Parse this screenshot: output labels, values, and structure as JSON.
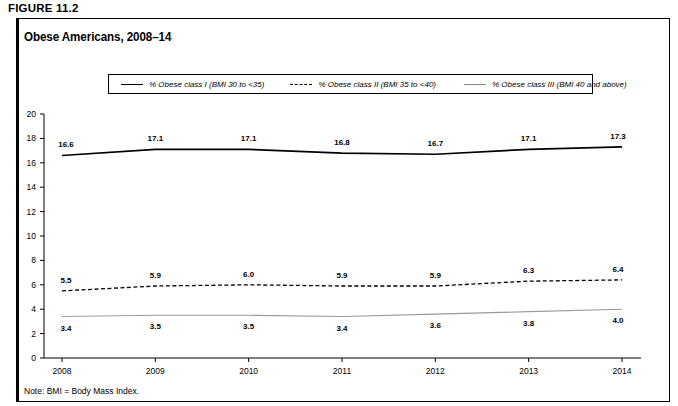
{
  "figure_label": "FIGURE 11.2",
  "chart_title": "Obese Americans, 2008–14",
  "note": "Note: BMI = Body Mass Index.",
  "legend": {
    "items": [
      {
        "label": "% Obese class I (BMI 30 to <35)",
        "style": "solid",
        "color": "#000000"
      },
      {
        "label": "% Obese class II (BMI 35 to <40)",
        "style": "dashed",
        "color": "#000000"
      },
      {
        "label": "% Obese class III (BMI 40 and above)",
        "style": "thin-solid",
        "color": "#8a8a8a"
      }
    ]
  },
  "chart_data": {
    "type": "line",
    "title": "Obese Americans, 2008–14",
    "xlabel": "",
    "ylabel": "",
    "categories": [
      "2008",
      "2009",
      "2010",
      "2011",
      "2012",
      "2013",
      "2014"
    ],
    "ylim": [
      0,
      20
    ],
    "yticks": [
      "0",
      "2",
      "4",
      "6",
      "8",
      "10",
      "12",
      "14",
      "16",
      "18",
      "20"
    ],
    "grid": false,
    "legend_position": "top",
    "series": [
      {
        "name": "% Obese class I (BMI 30 to <35)",
        "values": [
          16.6,
          17.1,
          17.1,
          16.8,
          16.7,
          17.1,
          17.3
        ],
        "labels": [
          "16.6",
          "17.1",
          "17.1",
          "16.8",
          "16.7",
          "17.1",
          "17.3"
        ]
      },
      {
        "name": "% Obese class II (BMI 35 to <40)",
        "values": [
          5.5,
          5.9,
          6.0,
          5.9,
          5.9,
          6.3,
          6.4
        ],
        "labels": [
          "5.5",
          "5.9",
          "6.0",
          "5.9",
          "5.9",
          "6.3",
          "6.4"
        ]
      },
      {
        "name": "% Obese class III (BMI 40 and above)",
        "values": [
          3.4,
          3.5,
          3.5,
          3.4,
          3.6,
          3.8,
          4.0
        ],
        "labels": [
          "3.4",
          "3.5",
          "3.5",
          "3.4",
          "3.6",
          "3.8",
          "4.0"
        ]
      }
    ]
  }
}
